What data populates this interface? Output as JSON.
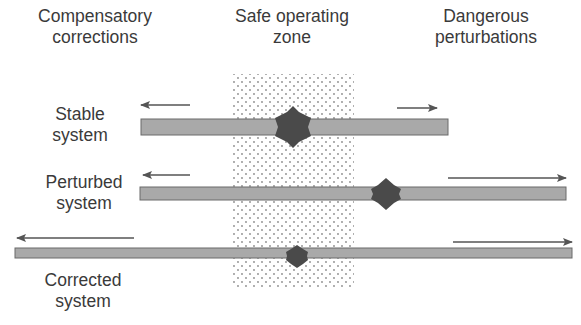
{
  "headers": {
    "left": {
      "line1": "Compensatory",
      "line2": "corrections"
    },
    "center": {
      "line1": "Safe operating",
      "line2": "zone"
    },
    "right": {
      "line1": "Dangerous",
      "line2": "perturbations"
    }
  },
  "rows": [
    {
      "name": "stable",
      "line1": "Stable",
      "line2": "system"
    },
    {
      "name": "perturbed",
      "line1": "Perturbed",
      "line2": "system"
    },
    {
      "name": "corrected",
      "line1": "Corrected",
      "line2": "system"
    }
  ],
  "colors": {
    "bar_fill": "#a9a9a9",
    "bar_edge": "#6a6a6a",
    "diamond": "#4a4a4a",
    "arrow": "#555555",
    "dots": "#8a8a8a",
    "text": "#3a3a3a"
  }
}
